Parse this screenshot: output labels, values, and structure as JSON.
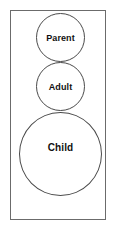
{
  "diagram": {
    "frame": {
      "border_color": "#6b6b6b"
    },
    "nodes": [
      {
        "id": "parent",
        "label": "Parent"
      },
      {
        "id": "adult",
        "label": "Adult"
      },
      {
        "id": "child",
        "label": "Child"
      }
    ]
  }
}
